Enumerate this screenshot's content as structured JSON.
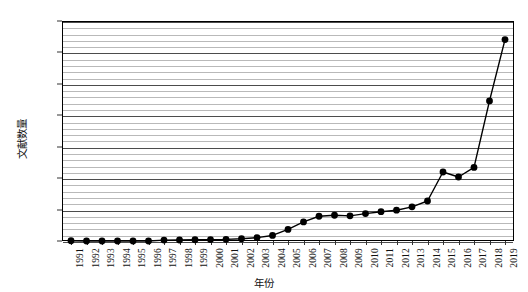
{
  "chart_data": {
    "type": "line",
    "title": "",
    "subtitle": "",
    "xlabel": "年份",
    "ylabel": "文献数量",
    "xlim": [
      1991,
      2019
    ],
    "ylim": [
      0,
      1750
    ],
    "grid": true,
    "legend": false,
    "legend_position": "none",
    "y_ticks": [
      0,
      250,
      500,
      750,
      1000,
      1250,
      1500,
      1750
    ],
    "y_minor_interval": 50,
    "marker": "filled-circle",
    "line_color": "#000000",
    "marker_color": "#000000",
    "grid_color": "#b9b9b9",
    "major_grid_color": "#4c4c4c",
    "categories": [
      "1991",
      "1992",
      "1993",
      "1994",
      "1995",
      "1996",
      "1997",
      "1998",
      "1999",
      "2000",
      "2001",
      "2002",
      "2003",
      "2004",
      "2005",
      "2006",
      "2007",
      "2008",
      "2009",
      "2010",
      "2011",
      "2012",
      "2013",
      "2014",
      "2015",
      "2016",
      "2017",
      "2018",
      "2019"
    ],
    "values": [
      2,
      0,
      0,
      0,
      0,
      0,
      7,
      8,
      10,
      11,
      13,
      18,
      27,
      44,
      92,
      152,
      197,
      205,
      200,
      218,
      233,
      245,
      272,
      318,
      549,
      509,
      585,
      1114,
      1602
    ],
    "series": [
      {
        "name": "文献数量",
        "values": [
          2,
          0,
          0,
          0,
          0,
          0,
          7,
          8,
          10,
          11,
          13,
          18,
          27,
          44,
          92,
          152,
          197,
          205,
          200,
          218,
          233,
          245,
          272,
          318,
          549,
          509,
          585,
          1114,
          1602
        ]
      }
    ]
  }
}
